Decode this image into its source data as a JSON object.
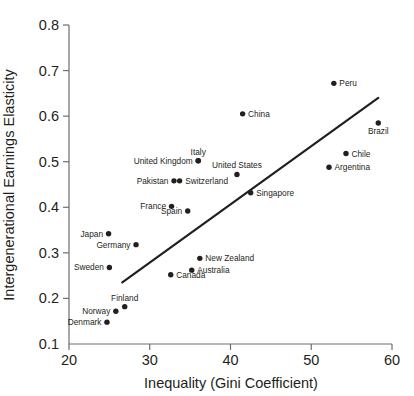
{
  "chart_data": {
    "type": "scatter",
    "title": "",
    "xlabel": "Inequality (Gini Coefficient)",
    "ylabel": "Intergenerational Earnings Elasticity",
    "xlim": [
      20,
      60
    ],
    "ylim": [
      0.1,
      0.8
    ],
    "xticks": [
      "20",
      "30",
      "40",
      "50",
      "60"
    ],
    "yticks": [
      "0.1",
      "0.2",
      "0.3",
      "0.4",
      "0.5",
      "0.6",
      "0.7",
      "0.8"
    ],
    "xtick_values": [
      20,
      30,
      40,
      50,
      60
    ],
    "ytick_values": [
      0.1,
      0.2,
      0.3,
      0.4,
      0.5,
      0.6,
      0.7,
      0.8
    ],
    "grid": false,
    "legend": false,
    "marker_color": "#231f20",
    "trendline": {
      "label": "",
      "color": "#231f20",
      "x_start": 26.6,
      "y_start": 0.235,
      "x_end": 58.3,
      "y_end": 0.64
    },
    "points": [
      {
        "name": "Denmark",
        "x": 24.7,
        "y": 0.148,
        "label_side": "left"
      },
      {
        "name": "Norway",
        "x": 25.8,
        "y": 0.172,
        "label_side": "left"
      },
      {
        "name": "Finland",
        "x": 26.9,
        "y": 0.182,
        "label_side": "above"
      },
      {
        "name": "Sweden",
        "x": 25.0,
        "y": 0.268,
        "label_side": "left"
      },
      {
        "name": "Japan",
        "x": 24.9,
        "y": 0.342,
        "label_side": "left"
      },
      {
        "name": "Germany",
        "x": 28.3,
        "y": 0.318,
        "label_side": "left"
      },
      {
        "name": "Canada",
        "x": 32.6,
        "y": 0.252,
        "label_side": "right"
      },
      {
        "name": "Australia",
        "x": 35.2,
        "y": 0.262,
        "label_side": "right"
      },
      {
        "name": "New Zealand",
        "x": 36.2,
        "y": 0.288,
        "label_side": "right"
      },
      {
        "name": "France",
        "x": 32.7,
        "y": 0.402,
        "label_side": "left"
      },
      {
        "name": "Spain",
        "x": 34.7,
        "y": 0.392,
        "label_side": "left"
      },
      {
        "name": "Pakistan",
        "x": 33.0,
        "y": 0.458,
        "label_side": "left"
      },
      {
        "name": "Switzerland",
        "x": 33.7,
        "y": 0.458,
        "label_side": "right"
      },
      {
        "name": "United Kingdom",
        "x": 36.0,
        "y": 0.502,
        "label_side": "left"
      },
      {
        "name": "Italy",
        "x": 36.0,
        "y": 0.502,
        "label_side": "above"
      },
      {
        "name": "United States",
        "x": 40.8,
        "y": 0.472,
        "label_side": "above"
      },
      {
        "name": "Singapore",
        "x": 42.5,
        "y": 0.432,
        "label_side": "right"
      },
      {
        "name": "China",
        "x": 41.5,
        "y": 0.605,
        "label_side": "right"
      },
      {
        "name": "Argentina",
        "x": 52.2,
        "y": 0.488,
        "label_side": "right"
      },
      {
        "name": "Chile",
        "x": 54.3,
        "y": 0.518,
        "label_side": "right"
      },
      {
        "name": "Peru",
        "x": 52.8,
        "y": 0.672,
        "label_side": "right"
      },
      {
        "name": "Brazil",
        "x": 58.3,
        "y": 0.585,
        "label_side": "below"
      }
    ]
  }
}
